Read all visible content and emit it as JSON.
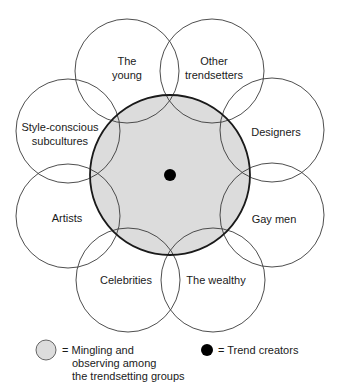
{
  "diagram": {
    "center": {
      "label": "Mingling and observing among the trendsetting groups",
      "fill": "#dcdcdc",
      "stroke": "#1a1a1a"
    },
    "core": {
      "label": "Trend creators",
      "fill": "#000000"
    },
    "groups": [
      {
        "id": "the-young",
        "line1": "The",
        "line2": "young"
      },
      {
        "id": "other-trendsetters",
        "line1": "Other",
        "line2": "trendsetters"
      },
      {
        "id": "designers",
        "line1": "Designers",
        "line2": ""
      },
      {
        "id": "gay-men",
        "line1": "Gay men",
        "line2": ""
      },
      {
        "id": "the-wealthy",
        "line1": "The wealthy",
        "line2": ""
      },
      {
        "id": "celebrities",
        "line1": "Celebrities",
        "line2": ""
      },
      {
        "id": "artists",
        "line1": "Artists",
        "line2": ""
      },
      {
        "id": "style-conscious-subcultures",
        "line1": "Style-conscious",
        "line2": "subcultures"
      }
    ]
  },
  "legend": {
    "mingling": {
      "line1": "= Mingling and",
      "line2": "observing among",
      "line3": "the trendsetting groups"
    },
    "trend_creators": {
      "line1": "= Trend creators"
    }
  }
}
